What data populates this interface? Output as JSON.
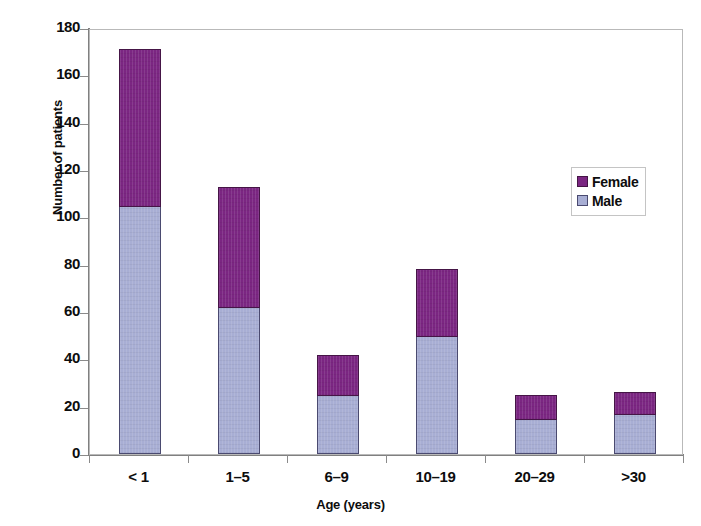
{
  "chart_data": {
    "type": "bar",
    "subtype": "stacked-vertical-bar",
    "title": "",
    "subtitle": "",
    "xlabel": "Age (years)",
    "ylabel": "Number of patients",
    "categories": [
      "< 1",
      "1–5",
      "6–9",
      "10–19",
      "20–29",
      ">30"
    ],
    "series": [
      {
        "name": "Male",
        "color": "#a8aed4",
        "values": [
          105,
          62,
          25,
          50,
          15,
          17
        ]
      },
      {
        "name": "Female",
        "color": "#7b2682",
        "values": [
          66,
          51,
          17,
          28,
          10,
          9
        ]
      }
    ],
    "stack_order": [
      "Male",
      "Female"
    ],
    "totals": [
      171,
      113,
      42,
      78,
      25,
      26
    ],
    "ylim": [
      0,
      180
    ],
    "ytick_step": 20,
    "yticks": [
      "180",
      "160",
      "140",
      "120",
      "100",
      "80",
      "60",
      "40",
      "20",
      "0"
    ],
    "ytick_values": [
      180,
      160,
      140,
      120,
      100,
      80,
      60,
      40,
      20,
      0
    ],
    "grid": false,
    "legend_position": "top-right-inside",
    "legend_entries": [
      "Female",
      "Male"
    ]
  },
  "axes": {
    "y_title": "Number of patients",
    "x_title": "Age (years)"
  },
  "legend": {
    "female_label": "Female",
    "male_label": "Male"
  },
  "colors": {
    "female": "#7b2682",
    "male": "#a8aed4",
    "axis": "#808080",
    "frame": "#b9b9b9",
    "text": "#0d0d0d",
    "background": "#ffffff"
  }
}
